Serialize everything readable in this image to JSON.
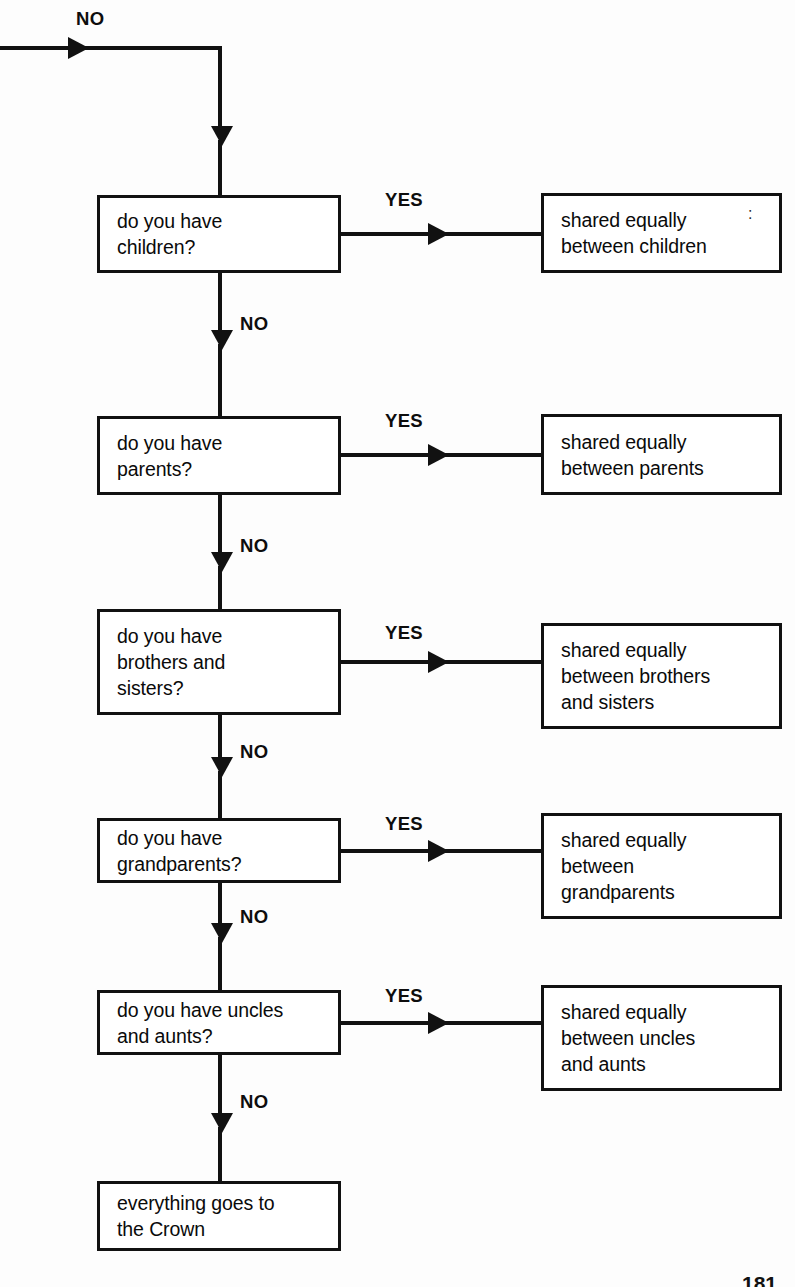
{
  "diagram": {
    "entry_label": "NO",
    "yes_label": "YES",
    "no_label": "NO",
    "page_number": "181"
  },
  "rows": [
    {
      "id": "children",
      "question": "do you have\nchildren?",
      "yes_label": "YES",
      "no_label": "NO",
      "outcome": "shared equally\nbetween children"
    },
    {
      "id": "parents",
      "question": "do you have\nparents?",
      "yes_label": "YES",
      "no_label": "NO",
      "outcome": "shared equally\nbetween parents"
    },
    {
      "id": "siblings",
      "question": "do you have\nbrothers and\nsisters?",
      "yes_label": "YES",
      "no_label": "NO",
      "outcome": "shared equally\nbetween brothers\nand sisters"
    },
    {
      "id": "grandparents",
      "question": "do you have\ngrandparents?",
      "yes_label": "YES",
      "no_label": "NO",
      "outcome": "shared equally\nbetween\ngrandparents"
    },
    {
      "id": "uncles-aunts",
      "question": "do you have uncles\nand aunts?",
      "yes_label": "YES",
      "no_label": "NO",
      "outcome": "shared equally\nbetween uncles\nand aunts"
    }
  ],
  "terminal": {
    "id": "crown",
    "text": "everything goes to\nthe Crown"
  }
}
